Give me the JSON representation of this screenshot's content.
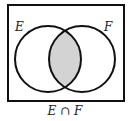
{
  "diagram": {
    "type": "venn",
    "universe": {
      "x": 8,
      "y": 5,
      "width": 116,
      "height": 96
    },
    "sets": [
      {
        "name": "E",
        "cx": 48,
        "cy": 59,
        "r": 33,
        "label_x": 14,
        "label_y": 30
      },
      {
        "name": "F",
        "cx": 82,
        "cy": 59,
        "r": 33,
        "label_x": 104,
        "label_y": 30
      }
    ],
    "shaded_region": "E ∩ F",
    "shade_color": "#d3d3d3",
    "stroke_color": "#111111",
    "caption": "E ∩ F"
  }
}
